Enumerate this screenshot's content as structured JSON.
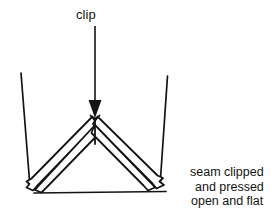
{
  "diagram": {
    "type": "technical-illustration",
    "background_color": "#ffffff",
    "ink_color": "#141414",
    "labels": {
      "clip": "clip",
      "caption_line_1": "seam clipped",
      "caption_line_2": "and pressed",
      "caption_line_3": "open and flat"
    },
    "annotation": {
      "arrow_name": "clip-pointer-arrow",
      "arrow_from": [
        95,
        26
      ],
      "arrow_to": [
        95,
        117
      ],
      "arrow_head": "solid-triangle-down"
    },
    "geometry": {
      "left_fabric_edge": {
        "x1": 21,
        "y1": 73,
        "x2": 30,
        "y2": 186
      },
      "right_fabric_edge": {
        "x1": 167,
        "y1": 76,
        "x2": 160,
        "y2": 185
      },
      "baseline": {
        "x1": 35,
        "y1": 193,
        "x2": 166,
        "y2": 192
      },
      "apex": [
        95,
        117
      ],
      "left_terminus": [
        30,
        190
      ],
      "right_terminus": [
        163,
        188
      ],
      "seam_stub": {
        "x1": 95,
        "y1": 120,
        "x2": 95,
        "y2": 143
      },
      "band_count_per_side": 2
    }
  }
}
